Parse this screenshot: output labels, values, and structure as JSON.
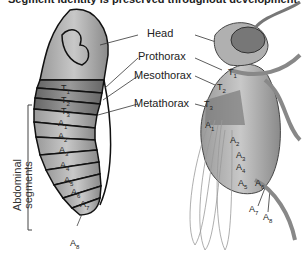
{
  "title": "Segment identity is preserved throughout development.",
  "labels": {
    "head": "Head",
    "prothorax": "Prothorax",
    "mesothorax": "Mesothorax",
    "metathorax": "Metathorax",
    "abdominal_line1": "Abdominal",
    "abdominal_line2": "segments"
  },
  "larva_segments": [
    "T1",
    "T2",
    "T3",
    "A1",
    "A2",
    "A3",
    "A4",
    "A5",
    "A6",
    "A7",
    "A8"
  ],
  "adult_segments": [
    "T1",
    "T2",
    "T3",
    "A1",
    "A2",
    "A3",
    "A4",
    "A5",
    "A6",
    "A7",
    "A8"
  ],
  "colors": {
    "head": "#b8b8b8",
    "thorax_dark": "#7a7a7a",
    "abdomen": "#a8a8a8",
    "outline": "#111111"
  }
}
